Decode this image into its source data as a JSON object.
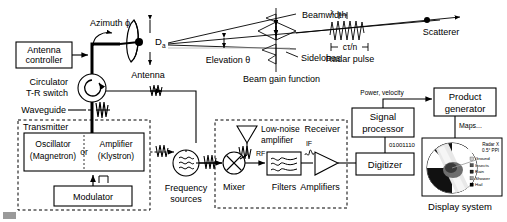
{
  "diagram": {
    "antenna_section": {
      "azimuth_label": "Azimuth ϕ",
      "elevation_label": "Elevation θ",
      "antenna_label": "Antenna",
      "antenna_diameter_label": "D",
      "antenna_diameter_sub": "a",
      "controller_label_line1": "Antenna",
      "controller_label_line2": "controller",
      "circulator_label_line1": "Circulator",
      "circulator_label_line2": "T-R switch",
      "waveguide_label": "Waveguide"
    },
    "beam_section": {
      "beamwidth_label": "Beamwidth",
      "sidelobes_label": "Sidelobes",
      "beam_gain_label": "Beam gain function",
      "wavelength_label": "λ",
      "pulse_length_label": "cτ/n",
      "radar_pulse_label": "Radar pulse",
      "scatterer_label": "Scatterer"
    },
    "transmitter": {
      "box_label": "Transmitter",
      "oscillator_line1": "Oscillator",
      "oscillator_line2": "(Magnetron)",
      "or_label": "or",
      "amplifier_line1": "Amplifier",
      "amplifier_line2": "(Klystron)",
      "modulator_label": "Modulator"
    },
    "frequency_sources": {
      "label_line1": "Frequency",
      "label_line2": "sources"
    },
    "receiver": {
      "box_label": "Receiver",
      "lna_line1": "Low-noise",
      "lna_line2": "amplifier",
      "rf_label": "RF",
      "if_label": "IF",
      "mixer_label": "Mixer",
      "filters_label": "Filters",
      "amplifiers_label": "Amplifiers"
    },
    "processing": {
      "digitizer_label": "Digitizer",
      "bitstream_label": "01001110",
      "signal_processor_line1": "Signal",
      "signal_processor_line2": "processor",
      "power_velocity_label": "Power, velocity",
      "product_generator_line1": "Product",
      "product_generator_line2": "generator",
      "maps_label": "Maps...",
      "display_system_label": "Display system"
    },
    "ppi": {
      "radar_label": "Radar X",
      "elevation_label": "0.5° PPI",
      "legend": [
        {
          "name": "Ground",
          "color": "#cccccc"
        },
        {
          "name": "Insects",
          "color": "#555555"
        },
        {
          "name": "Rain",
          "color": "#222222"
        },
        {
          "name": "Shower",
          "color": "#999999"
        },
        {
          "name": "Hail",
          "color": "#000000"
        }
      ]
    },
    "colors": {
      "line": "#000000",
      "background": "#ffffff",
      "dashed": "#000000"
    }
  }
}
